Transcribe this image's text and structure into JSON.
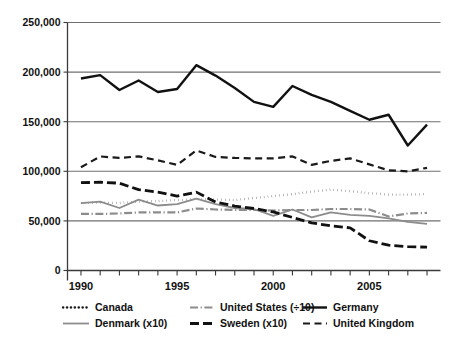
{
  "chart_data": {
    "type": "line",
    "title": "",
    "subtitle": "",
    "xlabel": "",
    "ylabel": "",
    "xlim": [
      1989.3,
      2008.7
    ],
    "ylim": [
      0,
      250000
    ],
    "grid": "horizontal",
    "legend_position": "bottom",
    "x": [
      1990,
      1991,
      1992,
      1993,
      1994,
      1995,
      1996,
      1997,
      1998,
      1999,
      2000,
      2001,
      2002,
      2003,
      2004,
      2005,
      2006,
      2007,
      2008
    ],
    "ytick_labels": [
      "0",
      "50,000",
      "100,000",
      "150,000",
      "200,000",
      "250,000"
    ],
    "ytick_values": [
      0,
      50000,
      100000,
      150000,
      200000,
      250000
    ],
    "xtick_labels": [
      "1990",
      "1995",
      "2000",
      "2005"
    ],
    "xtick_values": [
      1990,
      1995,
      2000,
      2005
    ],
    "xtick_minor_values": [
      1991,
      1992,
      1993,
      1994,
      1996,
      1997,
      1998,
      1999,
      2001,
      2002,
      2003,
      2004,
      2006,
      2007,
      2008
    ],
    "series": [
      {
        "name": "Canada",
        "legend_label": "Canada",
        "style": "dotted",
        "color": "#1a1a1a",
        "width": 2.3,
        "dash": "0.3,3.6",
        "values": [
          68000,
          68500,
          68000,
          69500,
          70000,
          71000,
          72000,
          71500,
          71000,
          73000,
          75000,
          77000,
          79500,
          81500,
          80000,
          78000,
          76500,
          76500,
          77000
        ]
      },
      {
        "name": "United States (÷10)",
        "legend_label": "United States (÷10)",
        "style": "dash-dot",
        "color": "#8c8c8c",
        "width": 2.2,
        "dash": "8,2.6,1.2,2.6",
        "values": [
          57000,
          57000,
          57500,
          58500,
          58500,
          58500,
          62500,
          61500,
          61000,
          61000,
          60500,
          61000,
          61000,
          62000,
          62000,
          61500,
          54500,
          57500,
          58000
        ]
      },
      {
        "name": "Germany",
        "legend_label": "Germany",
        "style": "solid",
        "color": "#111111",
        "width": 2.4,
        "dash": "none",
        "values": [
          193500,
          197000,
          182000,
          191500,
          180000,
          183000,
          207000,
          196500,
          184000,
          170000,
          165000,
          186000,
          177000,
          170000,
          161000,
          152000,
          157000,
          126000,
          147000
        ]
      },
      {
        "name": "Denmark (x10)",
        "legend_label": "Denmark (x10)",
        "style": "solid",
        "color": "#8c8c8c",
        "width": 1.8,
        "dash": "none",
        "values": [
          68000,
          69500,
          63000,
          71500,
          65500,
          67000,
          72500,
          67000,
          63000,
          62000,
          55000,
          61500,
          53500,
          58500,
          56000,
          55000,
          52500,
          49000,
          47000
        ]
      },
      {
        "name": "Sweden (x10)",
        "legend_label": "Sweden (x10)",
        "style": "dashed-heavy",
        "color": "#111111",
        "width": 2.8,
        "dash": "9,4",
        "values": [
          88500,
          89000,
          88000,
          81500,
          79000,
          75000,
          79000,
          69000,
          65000,
          62500,
          59000,
          53500,
          48000,
          45000,
          43000,
          30000,
          25500,
          24000,
          23500
        ]
      },
      {
        "name": "United Kingdom",
        "legend_label": "United Kingdom",
        "style": "dashed",
        "color": "#1a1a1a",
        "width": 2.2,
        "dash": "7,4.5",
        "values": [
          104000,
          115000,
          113500,
          115000,
          111000,
          106500,
          121000,
          114500,
          113500,
          113000,
          113000,
          115000,
          106500,
          110500,
          113000,
          107000,
          101000,
          100000,
          103500
        ]
      }
    ]
  }
}
